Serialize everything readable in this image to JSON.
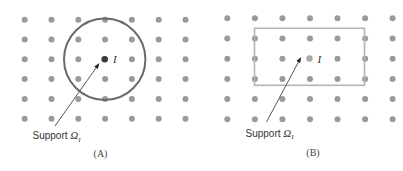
{
  "panels": [
    {
      "id": "A",
      "caption": "(A)",
      "support_shape": "circle",
      "node_label": "I",
      "support_label": "Support ",
      "support_symbol": "Ω",
      "support_subscript": "I",
      "grid": {
        "columns": 7,
        "rows": 6
      },
      "colors": {
        "dot": "#9a9a9a",
        "center_dot": "#3a3a3a",
        "outline": "#6a6a6a"
      }
    },
    {
      "id": "B",
      "caption": "(B)",
      "support_shape": "rectangle",
      "node_label": "I",
      "support_label": "Support ",
      "support_symbol": "Ω",
      "support_subscript": "I",
      "grid": {
        "columns": 7,
        "rows": 6
      },
      "colors": {
        "dot": "#9a9a9a",
        "center_dot": "#a8a8a8",
        "outline": "#b4b4b4"
      }
    }
  ]
}
